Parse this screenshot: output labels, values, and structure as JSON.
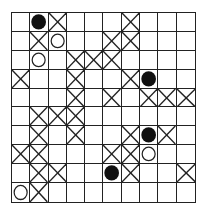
{
  "board": {
    "rows": 10,
    "cols": 10,
    "legend": {
      "X": "cross-mark",
      "B": "black-stone",
      "W": "white-circle",
      "_": "empty"
    },
    "cells": [
      [
        "_",
        "B",
        "X",
        "_",
        "_",
        "_",
        "X",
        "_",
        "_",
        "_"
      ],
      [
        "_",
        "X",
        "W",
        "_",
        "_",
        "X",
        "X",
        "_",
        "_",
        "_"
      ],
      [
        "_",
        "W",
        "_",
        "X",
        "X",
        "X",
        "_",
        "_",
        "_",
        "_"
      ],
      [
        "X",
        "_",
        "_",
        "X",
        "_",
        "_",
        "X",
        "B",
        "_",
        "_"
      ],
      [
        "_",
        "_",
        "_",
        "X",
        "_",
        "X",
        "_",
        "X",
        "X",
        "X"
      ],
      [
        "_",
        "X",
        "X",
        "X",
        "_",
        "_",
        "_",
        "_",
        "_",
        "_"
      ],
      [
        "_",
        "X",
        "_",
        "X",
        "_",
        "_",
        "X",
        "B",
        "X",
        "_"
      ],
      [
        "X",
        "X",
        "_",
        "_",
        "_",
        "X",
        "X",
        "W",
        "_",
        "_"
      ],
      [
        "_",
        "X",
        "X",
        "_",
        "_",
        "B",
        "X",
        "_",
        "_",
        "X"
      ],
      [
        "W",
        "X",
        "_",
        "_",
        "_",
        "_",
        "_",
        "_",
        "_",
        "_"
      ]
    ],
    "colors": {
      "line": "#222222",
      "black_stone": "#111111",
      "background": "#ffffff"
    }
  }
}
